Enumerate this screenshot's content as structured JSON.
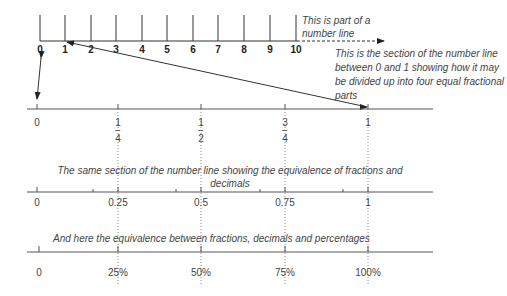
{
  "top_line": {
    "ticks": [
      "0",
      "1",
      "2",
      "3",
      "4",
      "5",
      "6",
      "7",
      "8",
      "9",
      "10"
    ],
    "note": "This is part of a number line"
  },
  "section_note": "This is the section of the number line between 0 and 1 showing how it may be divided up into four equal fractional parts",
  "fraction_line": {
    "labels": [
      {
        "type": "whole",
        "text": "0"
      },
      {
        "type": "frac",
        "num": "1",
        "den": "4"
      },
      {
        "type": "frac",
        "num": "1",
        "den": "2"
      },
      {
        "type": "frac",
        "num": "3",
        "den": "4"
      },
      {
        "type": "whole",
        "text": "1"
      }
    ]
  },
  "decimal_note": "The same section of the number line showing the equivalence of fractions and decimals",
  "decimal_line": {
    "labels": [
      "0",
      "0.25",
      "0.5",
      "0.75",
      "1"
    ]
  },
  "percent_note": "And here the equivalence between fractions, decimals and percentages",
  "percent_line": {
    "labels": [
      "0",
      "25%",
      "50%",
      "75%",
      "100%"
    ]
  }
}
